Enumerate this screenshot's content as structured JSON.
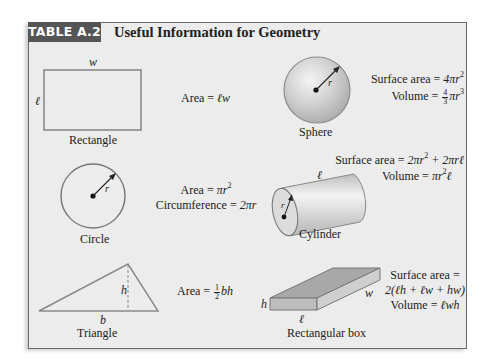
{
  "table": {
    "tag": "TABLE A.2",
    "title": "Useful Information for Geometry"
  },
  "shapes": [
    {
      "id": "rectangle",
      "name": "Rectangle",
      "dimension_labels": {
        "top": "w",
        "left": "ℓ"
      },
      "formulas": {
        "area": "Area = ℓw"
      }
    },
    {
      "id": "sphere",
      "name": "Sphere",
      "dimension_labels": {
        "radius": "r"
      },
      "formulas": {
        "surface_area": "Surface area = 4πr²",
        "volume": "Volume = (4/3)πr³"
      }
    },
    {
      "id": "circle",
      "name": "Circle",
      "dimension_labels": {
        "radius": "r"
      },
      "formulas": {
        "area": "Area = πr²",
        "circumference": "Circumference = 2πr"
      }
    },
    {
      "id": "cylinder",
      "name": "Cylinder",
      "dimension_labels": {
        "length": "ℓ",
        "radius": "r"
      },
      "formulas": {
        "surface_area": "Surface area = 2πr² + 2πrℓ",
        "volume": "Volume = πr²ℓ"
      }
    },
    {
      "id": "triangle",
      "name": "Triangle",
      "dimension_labels": {
        "height": "h",
        "base": "b"
      },
      "formulas": {
        "area": "Area = (1/2)bh"
      }
    },
    {
      "id": "rectangular-box",
      "name": "Rectangular box",
      "dimension_labels": {
        "height": "h",
        "length": "ℓ",
        "width": "w"
      },
      "formulas": {
        "surface_area_line1": "Surface area =",
        "surface_area_line2": "2(ℓh + ℓw + hw)",
        "volume": "Volume = ℓwh"
      }
    }
  ],
  "text": {
    "area_prefix": "Area = ",
    "surface_area_prefix": "Surface area = ",
    "volume_prefix": "Volume = ",
    "circumference_prefix": "Circumference = ",
    "rect_area_rhs": "ℓw",
    "sphere_sa_rhs": "4πr",
    "sphere_vol_rhs": "πr",
    "circle_area_rhs": "πr",
    "circle_circ_rhs": "2πr",
    "cyl_sa_rhs_a": "2πr",
    "cyl_sa_rhs_b": " + 2πrℓ",
    "cyl_vol_rhs_a": "πr",
    "cyl_vol_rhs_b": "ℓ",
    "tri_area_rhs": "bh",
    "box_sa_line1": "Surface area =",
    "box_sa_line2": "2(ℓh + ℓw + hw)",
    "box_vol_rhs": "ℓwh",
    "exp2": "2",
    "exp3": "3",
    "frac_one": "1",
    "frac_two": "2",
    "frac_four": "4",
    "frac_three": "3"
  },
  "colors": {
    "tag_bg": "#555555",
    "panel_bg": "#ececec",
    "frame_border": "#6a6a6a",
    "shape_stroke": "#7a7a7a"
  }
}
